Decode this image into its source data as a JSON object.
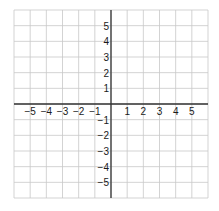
{
  "diagram": {
    "type": "coordinate-grid",
    "x_range": [
      -6,
      6
    ],
    "y_range": [
      -6,
      6
    ],
    "grid": true,
    "x_tick_labels": [
      "−5",
      "−4",
      "−3",
      "−2",
      "−1",
      "1",
      "2",
      "3",
      "4",
      "5"
    ],
    "x_tick_values": [
      -5,
      -4,
      -3,
      -2,
      -1,
      1,
      2,
      3,
      4,
      5
    ],
    "y_tick_labels": [
      "5",
      "4",
      "3",
      "2",
      "1",
      "−1",
      "−2",
      "−3",
      "−4",
      "−5"
    ],
    "y_tick_values": [
      5,
      4,
      3,
      2,
      1,
      -1,
      -2,
      -3,
      -4,
      -5
    ],
    "colors": {
      "grid": "#c8c8c8",
      "axis": "#333333",
      "label": "#1a1a1a"
    }
  }
}
